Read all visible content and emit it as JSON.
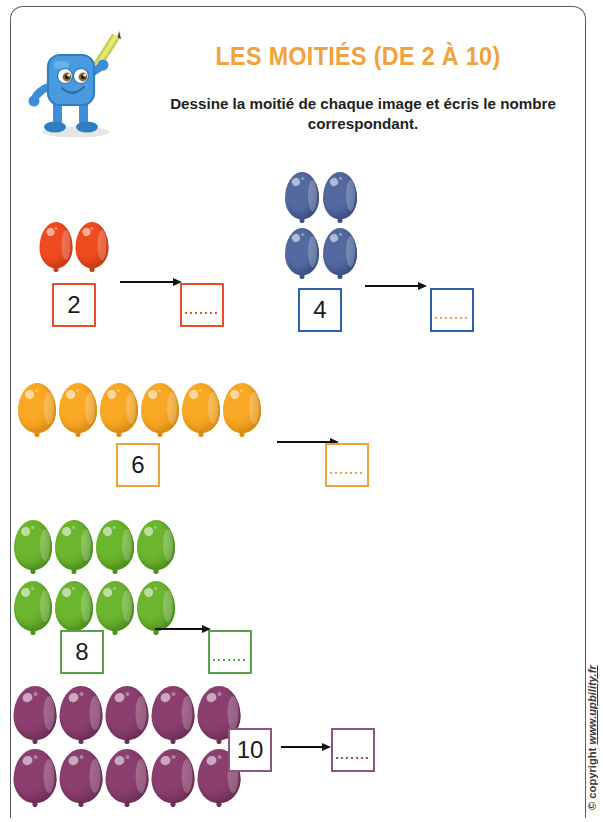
{
  "page": {
    "title": "LES MOITIÉS (DE 2 À 10)",
    "subtitle": "Dessine la moitié de chaque image et écris le nombre correspondant.",
    "copyright_mark": "© copyright ",
    "copyright_url": "www.upbility.fr",
    "title_color": "#f0a23c",
    "frame_color": "#5a5a60"
  },
  "mascot": {
    "name": "blue-square-character-with-pencil",
    "body_color": "#4a9ae0",
    "body_shade": "#2e78c4",
    "pencil_color": "#d9e05a",
    "pencil_tip_color": "#6b4a2a"
  },
  "exercises": [
    {
      "id": "exercise-2",
      "count": 2,
      "number_label": "2",
      "answer_placeholder": "",
      "color": "#e8502a",
      "balloon_color": "#f04a20",
      "balloon_shade": "#c83c16",
      "rows": 1,
      "columns": 2
    },
    {
      "id": "exercise-4",
      "count": 4,
      "number_label": "4",
      "answer_placeholder": "",
      "color": "#2c5fae",
      "balloon_color": "#53699f",
      "balloon_shade": "#3d5186",
      "rows": 2,
      "columns": 2
    },
    {
      "id": "exercise-6",
      "count": 6,
      "number_label": "6",
      "answer_placeholder": "",
      "color": "#eda33c",
      "balloon_color": "#f9a825",
      "balloon_shade": "#d98c12",
      "rows": 1,
      "columns": 6
    },
    {
      "id": "exercise-8",
      "count": 8,
      "number_label": "8",
      "answer_placeholder": "",
      "color": "#5da04a",
      "balloon_color": "#6cb52f",
      "balloon_shade": "#4e8f1d",
      "rows": 2,
      "columns": 4
    },
    {
      "id": "exercise-10",
      "count": 10,
      "number_label": "10",
      "answer_placeholder": "",
      "color": "#8a5580",
      "balloon_color": "#8b3f6e",
      "balloon_shade": "#6e2f57",
      "rows": 2,
      "columns": 5
    }
  ]
}
